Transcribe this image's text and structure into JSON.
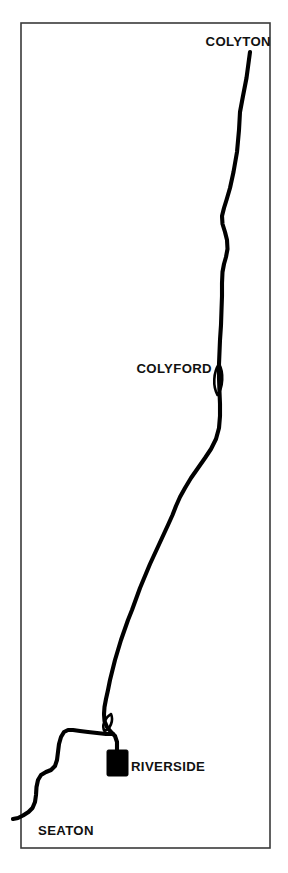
{
  "figure": {
    "kind": "route-map",
    "background_color": "#ffffff",
    "frame_color": "#3a3a3a",
    "route_color": "#000000",
    "label_color": "#111111"
  },
  "frame": {
    "x": 21,
    "y": 23,
    "width": 249,
    "height": 825
  },
  "labels": {
    "colyton": "COLYTON",
    "colyford": "COLYFORD",
    "riverside": "RIVERSIDE",
    "seaton": "SEATON"
  },
  "stations": [
    {
      "name": "COLYTON",
      "label": "COLYTON",
      "marker": "line-terminus",
      "label_x": 271,
      "label_y": 46,
      "label_anchor": "end",
      "node_x": 250,
      "node_y": 52
    },
    {
      "name": "COLYFORD",
      "label": "COLYFORD",
      "marker": "passing-loop",
      "label_x": 212,
      "label_y": 373,
      "label_anchor": "end",
      "node_x": 219,
      "node_y": 380
    },
    {
      "name": "RIVERSIDE",
      "label": "RIVERSIDE",
      "marker": "filled-rectangle",
      "label_x": 131,
      "label_y": 771,
      "label_anchor": "start",
      "node_x": 117,
      "node_y": 763,
      "marker_x": 107,
      "marker_y": 750,
      "marker_width": 21,
      "marker_height": 26
    },
    {
      "name": "SEATON",
      "label": "SEATON",
      "marker": "line-terminus",
      "label_x": 38,
      "label_y": 835,
      "label_anchor": "start",
      "node_x": 33,
      "node_y": 822
    }
  ],
  "route": {
    "name": "Seaton Tramway",
    "main_path": "M 250 52 L 246.5 78 L 243 96 L 240 112 L 239 130 L 237 152 L 233.5 172 L 230 188 L 226.5 200 L 224 208 L 222 216 L 222.5 224 L 225 232 L 227 240 L 227.5 249 L 226 257 L 224 264 L 222.5 272 L 222 283 L 222 296 L 221.5 310 L 221 325 L 220 340 L 219.5 352 L 219 364 L 219 378 L 219.5 392 L 220 404 L 220 416 L 219 428 L 216 439 L 211 449 L 205 458 L 198 468 L 191 478 L 185 488 L 180 497 L 176 506 L 172.5 515 L 168 525 L 162 538 L 156 551 L 150 564 L 145 576 L 140 588 L 136 599 L 132 610 L 128 620 L 124.5 630 L 121 640 L 118 650 L 115 660 L 112.5 670 L 110 680 L 108 690 L 106 699 L 104.5 707 L 104 714 L 104.5 721 L 107 727 L 111 732 L 115 736 L 117 742 L 117 750",
    "seaton_branch_path": "M 113 734 L 106 734 L 97 733 L 88 732 L 80 731 L 73 730 L 68 730 L 64 732 L 61 737 L 59 744 L 58 752 L 57 760 L 55 766 L 51 770 L 46 772 L 41 775 L 38 780 L 36.5 787 L 36 795 L 35 802 L 32.5 808 L 28.5 812 L 23 815.5 L 18 818 L 13 819",
    "colyford_loop_path": "M 219 364 C 213.5 372, 212.5 386, 217.5 395 C 223 387, 224 373, 219 364 Z",
    "riverside_loop_path": "M 111 714 C 104.5 718, 101.5 726, 104.5 731 C 110 729, 114 721, 111 714 Z",
    "stroke_width": 4.1,
    "loop_stroke_width": 2.6
  }
}
